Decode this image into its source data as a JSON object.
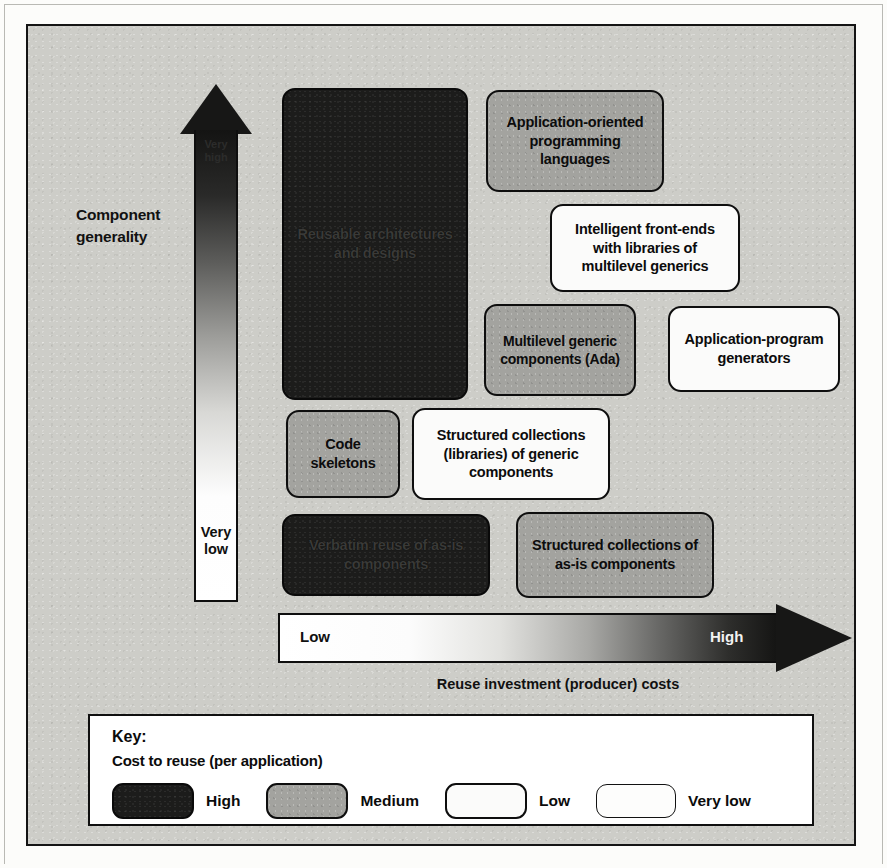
{
  "figure": {
    "y_axis": {
      "label": "Component generality",
      "arrow_top_label": "Very high",
      "arrow_bottom_label": "Very low"
    },
    "x_axis": {
      "label": "Reuse investment (producer) costs",
      "arrow_left_label": "Low",
      "arrow_right_label": "High"
    },
    "boxes": [
      {
        "id": "reusable-architectures",
        "text": "Reusable architectures and designs",
        "cost": "High"
      },
      {
        "id": "application-oriented-languages",
        "text": "Application-oriented programming languages",
        "cost": "Medium"
      },
      {
        "id": "intelligent-front-ends",
        "text": "Intelligent front-ends with libraries of multilevel generics",
        "cost": "Low"
      },
      {
        "id": "multilevel-generic-components",
        "text": "Multilevel generic components (Ada)",
        "cost": "Medium"
      },
      {
        "id": "application-program-generators",
        "text": "Application-program generators",
        "cost": "Low"
      },
      {
        "id": "code-skeletons",
        "text": "Code skeletons",
        "cost": "Medium"
      },
      {
        "id": "structured-generic-collections",
        "text": "Structured collections (libraries) of generic components",
        "cost": "Low"
      },
      {
        "id": "verbatim-components",
        "text": "Verbatim reuse of as-is components",
        "cost": "High"
      },
      {
        "id": "structured-as-is-collections",
        "text": "Structured collections of as-is components",
        "cost": "Medium"
      }
    ]
  },
  "key": {
    "title": "Key:",
    "subtitle": "Cost to reuse (per application)",
    "items": [
      {
        "label": "High",
        "fill": "#1c1c1b"
      },
      {
        "label": "Medium",
        "fill": "#a3a39f"
      },
      {
        "label": "Low",
        "fill": "#fbfbfa"
      },
      {
        "label": "Very low",
        "fill": "#fdfdfc"
      }
    ]
  },
  "colors": {
    "panel_background": "#cdcdc8",
    "ink": "#111111",
    "high_fill": "#1c1c1b",
    "medium_fill": "#a3a39f",
    "low_fill": "#fbfbfa"
  }
}
